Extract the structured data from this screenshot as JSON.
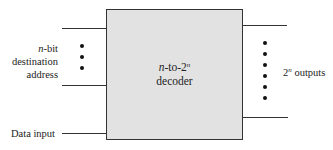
{
  "diagram": {
    "type": "block-diagram",
    "block": {
      "label_line1_var": "n",
      "label_line1_mid": "-to-2",
      "label_line1_sup": "n",
      "label_line2": "decoder",
      "fill": "#e2e2e2",
      "stroke": "#333333"
    },
    "inputs": {
      "address": {
        "label_var": "n",
        "label_line1": "-bit",
        "label_line2": "destination",
        "label_line3": "address",
        "ellipsis_dots": 3
      },
      "data": {
        "label": "Data input"
      }
    },
    "outputs": {
      "label_prefix": "2",
      "label_sup": "n",
      "label_suffix": " outputs",
      "ellipsis_dots": 6
    }
  }
}
